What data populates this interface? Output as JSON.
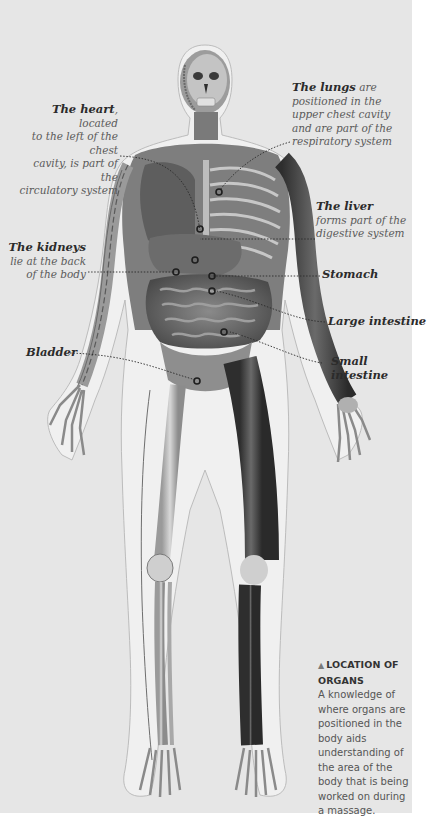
{
  "figure": {
    "annotations": [
      {
        "id": "heart",
        "bold": "The heart",
        "text": ", located to the left of the chest cavity, is part of the circulatory system"
      },
      {
        "id": "lungs",
        "bold": "The lungs",
        "text": " are positioned in the upper chest cavity and are part of the respiratory system"
      },
      {
        "id": "liver",
        "bold": "The liver",
        "text": "forms part of the digestive system"
      },
      {
        "id": "kidneys",
        "bold": "The kidneys",
        "text": "lie at the back of the body"
      },
      {
        "id": "stomach",
        "bold": "Stomach",
        "text": ""
      },
      {
        "id": "large_intestine",
        "bold": "Large intestine",
        "text": ""
      },
      {
        "id": "bladder",
        "bold": "Bladder",
        "text": ""
      },
      {
        "id": "small_intestine",
        "bold": "Small intestine",
        "text": ""
      }
    ]
  },
  "labels": {
    "heart_bold": "The heart",
    "heart_l1": ", located",
    "heart_l2": "to the left of the chest",
    "heart_l3": "cavity, is part of the",
    "heart_l4": "circulatory system",
    "lungs_bold": "The lungs",
    "lungs_l1": " are",
    "lungs_l2": "positioned in the",
    "lungs_l3": "upper chest cavity",
    "lungs_l4": "and are part of the",
    "lungs_l5": "respiratory system",
    "liver_bold": "The liver",
    "liver_l2": "forms part of the",
    "liver_l3": "digestive system",
    "kidneys_bold": "The kidneys",
    "kidneys_l2": "lie at the back",
    "kidneys_l3": "of the body",
    "stomach": "Stomach",
    "large_intestine": "Large intestine",
    "bladder": "Bladder",
    "small_intestine_l1": "Small",
    "small_intestine_l2": "intestine"
  },
  "caption": {
    "marker": "▲",
    "title": "LOCATION OF ORGANS",
    "body": "A knowledge of where organs are positioned in the body aids understanding of the area of the body that is being worked on during a massage."
  },
  "colors": {
    "page_background": "#e6e6e6",
    "margin": "#ffffff",
    "label_bold": "#2b2b2b",
    "label_text": "#5a5a5a"
  }
}
